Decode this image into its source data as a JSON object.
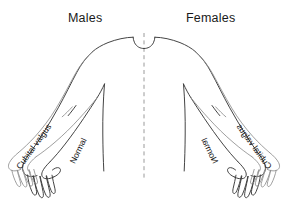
{
  "figure": {
    "type": "anatomical-diagram",
    "background_color": "#ffffff",
    "line_color": "#3a3a3a",
    "valgus_line_color": "#8e8e8e",
    "midline_color": "#9a9a9a"
  },
  "headers": {
    "left": "Males",
    "right": "Females"
  },
  "labels": {
    "cubital_valgus_left": "Cubital valgus",
    "normal_left": "Normal",
    "cubital_valgus_right": "Cubital valgus",
    "normal_right": "Normal"
  },
  "midline": {
    "name": "body-midline",
    "style": "dashed"
  }
}
